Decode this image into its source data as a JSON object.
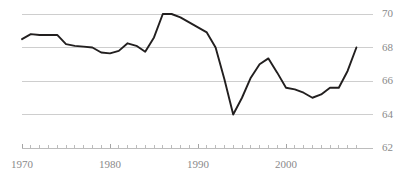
{
  "chart_data": {
    "type": "line",
    "title": "",
    "subtitle": "",
    "xlabel": "",
    "ylabel": "",
    "xlim": [
      1969,
      2009
    ],
    "ylim": [
      62,
      70
    ],
    "grid": true,
    "grid_axis": "y",
    "legend": false,
    "legend_position": "none",
    "line_color": "#221f1f",
    "grid_color": "#c9c9c9",
    "axis_color": "#b5b5b5",
    "tick_label_color": "#8a8a8a",
    "y_ticks": [
      62,
      64,
      66,
      68,
      70
    ],
    "y_tick_labels": [
      "62",
      "64",
      "66",
      "68",
      "70"
    ],
    "y_tick_side": "right",
    "x_ticks": [
      1970,
      1980,
      1990,
      2000
    ],
    "x_tick_labels": [
      "1970",
      "1980",
      "1990",
      "2000"
    ],
    "x_minor_tick_interval": 1,
    "series": [
      {
        "name": "series-1",
        "x": [
          1970,
          1971,
          1972,
          1973,
          1974,
          1975,
          1976,
          1977,
          1978,
          1979,
          1980,
          1981,
          1982,
          1983,
          1984,
          1985,
          1986,
          1987,
          1988,
          1989,
          1990,
          1991,
          1992,
          1993,
          1994,
          1995,
          1996,
          1997,
          1998,
          1999,
          2000,
          2001,
          2002,
          2003,
          2004,
          2005,
          2006,
          2007,
          2008
        ],
        "values": [
          68.5,
          68.8,
          68.75,
          68.75,
          68.75,
          68.2,
          68.1,
          68.05,
          68.0,
          67.7,
          67.65,
          67.8,
          68.25,
          68.1,
          67.75,
          68.6,
          70.0,
          70.0,
          69.8,
          69.5,
          69.2,
          68.9,
          68.0,
          66.1,
          64.0,
          65.0,
          66.2,
          67.0,
          67.35,
          66.5,
          65.6,
          65.5,
          65.3,
          65.0,
          65.2,
          65.6,
          65.6,
          66.6,
          68.0
        ]
      }
    ]
  },
  "chart_meta": {
    "plot_left_px": 22,
    "plot_right_px": 374,
    "plot_top_px": 14,
    "plot_bottom_px": 148
  }
}
